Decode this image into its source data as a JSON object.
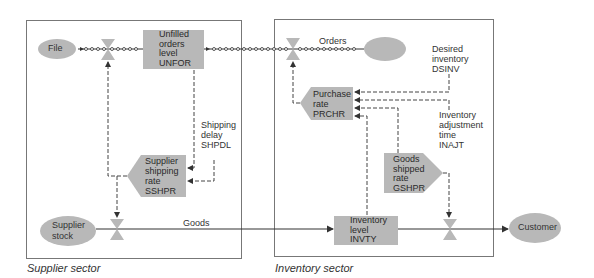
{
  "sectors": {
    "supplier": "Supplier sector",
    "inventory": "Inventory sector"
  },
  "clouds": {
    "file": "File",
    "supplier_stock": [
      "Supplier",
      "stock"
    ],
    "customer": "Customer"
  },
  "levels": {
    "unfilled_orders": [
      "Unfilled",
      "orders",
      "level",
      "UNFOR"
    ],
    "inventory_level": [
      "Inventory",
      "level",
      "INVTY"
    ]
  },
  "rates": {
    "supplier_shipping": [
      "Supplier",
      "shipping",
      "rate",
      "SSHPR"
    ],
    "purchase": [
      "Purchase",
      "rate",
      "PRCHR"
    ],
    "goods_shipped": [
      "Goods",
      "shipped",
      "rate",
      "GSHPR"
    ]
  },
  "auxiliaries": {
    "shipping_delay": [
      "Shipping",
      "delay",
      "SHPDL"
    ],
    "desired_inventory": [
      "Desired",
      "inventory",
      "DSINV"
    ],
    "inventory_adjustment_time": [
      "Inventory",
      "adjustment",
      "time",
      "INAJT"
    ]
  },
  "flows": {
    "orders": "Orders",
    "goods": "Goods"
  },
  "colors": {
    "shape_fill": "#b8b8b8",
    "line": "#333333",
    "box": "#777777"
  }
}
